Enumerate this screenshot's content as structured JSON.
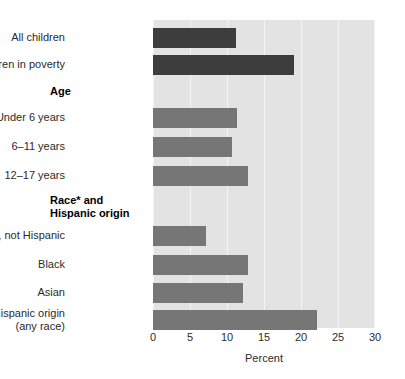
{
  "chart_data": {
    "type": "bar",
    "orientation": "horizontal",
    "title": "",
    "xlabel": "Percent",
    "ylabel": "",
    "xlim": [
      0,
      30
    ],
    "xticks": [
      0,
      5,
      10,
      15,
      20,
      25,
      30
    ],
    "xtick_labels": [
      "0",
      "5",
      "10",
      "15",
      "20",
      "25",
      "30"
    ],
    "grid": true,
    "grid_axis": "x",
    "legend": "none",
    "categories": [
      "All children",
      "Children in poverty",
      "Under 6 years",
      "6–11 years",
      "12–17 years",
      "White, not Hispanic",
      "Black",
      "Asian",
      "Hispanic origin\n(any race)"
    ],
    "values": [
      11.2,
      19.1,
      11.4,
      10.7,
      12.8,
      7.2,
      12.8,
      12.2,
      22.2
    ],
    "group_headings": [
      {
        "label": "Age",
        "after_category_index": 1
      },
      {
        "label": "Race* and\nHispanic origin",
        "after_category_index": 4
      }
    ],
    "bars": [
      {
        "label": "All children",
        "value": 11.2,
        "color": "#3d3d3d",
        "group": null
      },
      {
        "label": "Children in poverty",
        "value": 19.1,
        "color": "#3d3d3d",
        "group": null
      },
      {
        "label": "Under 6 years",
        "value": 11.4,
        "color": "#767676",
        "group": "Age"
      },
      {
        "label": "6–11 years",
        "value": 10.7,
        "color": "#767676",
        "group": "Age"
      },
      {
        "label": "12–17 years",
        "value": 12.8,
        "color": "#767676",
        "group": "Age"
      },
      {
        "label": "White, not Hispanic",
        "value": 7.2,
        "color": "#767676",
        "group": "Race* and Hispanic origin"
      },
      {
        "label": "Black",
        "value": 12.8,
        "color": "#767676",
        "group": "Race* and Hispanic origin"
      },
      {
        "label": "Asian",
        "value": 12.2,
        "color": "#767676",
        "group": "Race* and Hispanic origin"
      },
      {
        "label": "Hispanic origin\n(any race)",
        "value": 22.2,
        "color": "#767676",
        "group": "Race* and Hispanic origin"
      }
    ],
    "colors": {
      "bar_dark": "#3d3d3d",
      "bar_mid": "#767676",
      "plot_background": "#e3e3e3",
      "gridline": "#f4f4f4",
      "text": "#2b2b2b",
      "page_background": "#ffffff"
    }
  },
  "labels": {
    "cat_0": "All children",
    "cat_1": "Children in poverty",
    "group_age": "Age",
    "cat_2": "Under 6 years",
    "cat_3": "6–11 years",
    "cat_4": "12–17 years",
    "group_race": "Race* and\nHispanic origin",
    "cat_5": "White, not Hispanic",
    "cat_6": "Black",
    "cat_7": "Asian",
    "cat_8": "Hispanic origin\n(any race)"
  },
  "axis": {
    "title": "Percent",
    "tick_0": "0",
    "tick_1": "5",
    "tick_2": "10",
    "tick_3": "15",
    "tick_4": "20",
    "tick_5": "25",
    "tick_6": "30"
  }
}
